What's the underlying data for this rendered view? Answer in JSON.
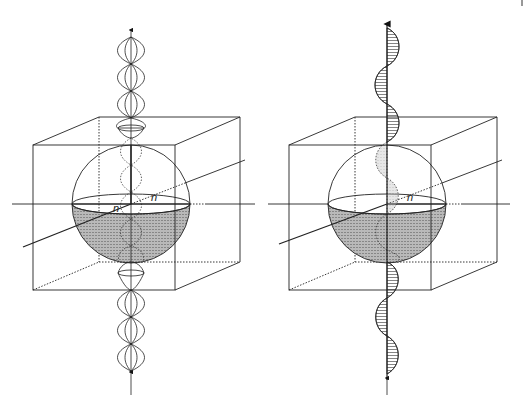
{
  "figure": {
    "panels": [
      {
        "id": "left",
        "description": "Sphere inside a cube with a standing-wave (linearly/rotating lobes) beam along the vertical axis",
        "axis_label_equator": "n",
        "axis_label_diagonal": "n",
        "wave_style": "lobes"
      },
      {
        "id": "right",
        "description": "Sphere inside a cube with a hatched sinusoidal wave along the vertical axis",
        "axis_label_equator": "n",
        "wave_style": "hatched-sine"
      }
    ],
    "colors": {
      "line": "#222222",
      "hemisphere_fill": "#b9b9b9",
      "background": "#ffffff"
    }
  }
}
